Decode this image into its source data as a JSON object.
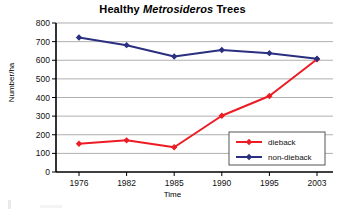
{
  "chart_data": {
    "type": "line",
    "title": "Healthy Metrosideros Trees",
    "title_parts": {
      "before": "Healthy ",
      "italic": "Metrosideros",
      "after": " Trees"
    },
    "xlabel": "Time",
    "ylabel": "Number/ha",
    "categories": [
      "1976",
      "1982",
      "1985",
      "1990",
      "1995",
      "2003"
    ],
    "ylim": [
      0,
      800
    ],
    "yticks": [
      "0",
      "100",
      "200",
      "300",
      "400",
      "500",
      "600",
      "700",
      "800"
    ],
    "grid": "horizontal",
    "legend_position": "inside-lower-right",
    "series": [
      {
        "name": "dieback",
        "color": "#ED1C24",
        "marker": "diamond",
        "values": [
          152,
          170,
          133,
          302,
          408,
          605
        ]
      },
      {
        "name": "non-dieback",
        "color": "#2B2F7F",
        "marker": "diamond",
        "values": [
          722,
          681,
          620,
          655,
          638,
          608
        ]
      }
    ]
  },
  "legend": {
    "entries": [
      {
        "label": "dieback"
      },
      {
        "label": "non-dieback"
      }
    ]
  },
  "axes": {
    "y_tick_labels": [
      "800",
      "700",
      "600",
      "500",
      "400",
      "300",
      "200",
      "100",
      "0"
    ],
    "x_tick_labels": [
      "1976",
      "1982",
      "1985",
      "1990",
      "1995",
      "2003"
    ]
  }
}
